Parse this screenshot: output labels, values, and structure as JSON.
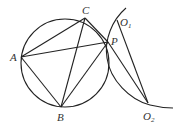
{
  "diagram": {
    "type": "geometry",
    "points": {
      "A": {
        "label": "A",
        "x": 21,
        "y": 57
      },
      "B": {
        "label": "B",
        "x": 61,
        "y": 107
      },
      "C": {
        "label": "C",
        "x": 85,
        "y": 18
      },
      "P": {
        "label": "P",
        "x": 108,
        "y": 42
      },
      "O1": {
        "label": "O",
        "sub": "1",
        "x": 117,
        "y": 20
      },
      "O2": {
        "label": "O",
        "sub": "2",
        "x": 148,
        "y": 103
      }
    },
    "segments": [
      [
        "A",
        "C"
      ],
      [
        "A",
        "P"
      ],
      [
        "A",
        "B"
      ],
      [
        "B",
        "C"
      ],
      [
        "B",
        "P"
      ],
      [
        "C",
        "P"
      ],
      [
        "O1",
        "O2"
      ],
      [
        "P",
        "O2"
      ]
    ],
    "circles": [
      {
        "name": "circle-O1",
        "center": [
          65,
          64
        ],
        "radius": 45
      }
    ],
    "arcs": [
      {
        "name": "arc-O2",
        "through": [
          "O1",
          "P",
          "O2"
        ]
      }
    ],
    "colors": {
      "stroke": "#222222",
      "label": "#333333",
      "background": "#ffffff"
    }
  }
}
